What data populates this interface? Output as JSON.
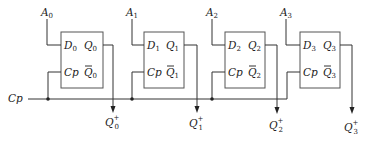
{
  "diagram": {
    "type": "circuit",
    "clock_label": "Cp",
    "flip_flops": [
      {
        "index": "0",
        "input_label": "A",
        "d_label": "D",
        "cp_label": "Cp",
        "q_label": "Q",
        "qbar_label": "Q",
        "out_label": "Q",
        "out_sup": "+"
      },
      {
        "index": "1",
        "input_label": "A",
        "d_label": "D",
        "cp_label": "Cp",
        "q_label": "Q",
        "qbar_label": "Q",
        "out_label": "Q",
        "out_sup": "+"
      },
      {
        "index": "2",
        "input_label": "A",
        "d_label": "D",
        "cp_label": "Cp",
        "q_label": "Q",
        "qbar_label": "Q",
        "out_label": "Q",
        "out_sup": "+"
      },
      {
        "index": "3",
        "input_label": "A",
        "d_label": "D",
        "cp_label": "Cp",
        "q_label": "Q",
        "qbar_label": "Q",
        "out_label": "Q",
        "out_sup": "+"
      }
    ]
  }
}
